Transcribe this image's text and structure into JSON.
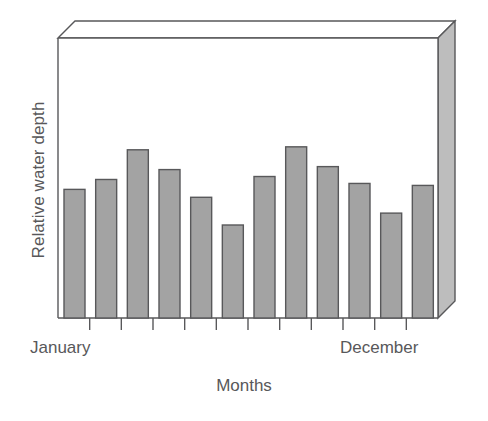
{
  "chart_data": {
    "type": "bar",
    "title": "",
    "subtitle": "",
    "xlabel": "Months",
    "ylabel": "Relative water depth",
    "categories": [
      "January",
      "February",
      "March",
      "April",
      "May",
      "June",
      "July",
      "August",
      "September",
      "October",
      "November",
      "December"
    ],
    "tick_labels_shown": [
      "January",
      "December"
    ],
    "values": [
      130,
      140,
      170,
      150,
      122,
      94,
      143,
      173,
      153,
      136,
      106,
      134
    ],
    "ylim": [
      0,
      283
    ],
    "y_axis_ticks": [],
    "grid": false,
    "legend": null,
    "n_bars": 12,
    "n_tick_marks": 11,
    "annotations": [],
    "style": {
      "three_d_box": true,
      "bar_fill": "#a3a3a3",
      "bar_stroke": "#58585a",
      "box_side_fill": "#bdbdbd",
      "box_top_fill": "#ffffff",
      "axis_stroke": "#58585a",
      "background": "#ffffff",
      "text_color": "#58585a"
    }
  },
  "axis": {
    "ylabel": "Relative water depth",
    "xlabel": "Months",
    "first_category": "January",
    "last_category": "December"
  }
}
